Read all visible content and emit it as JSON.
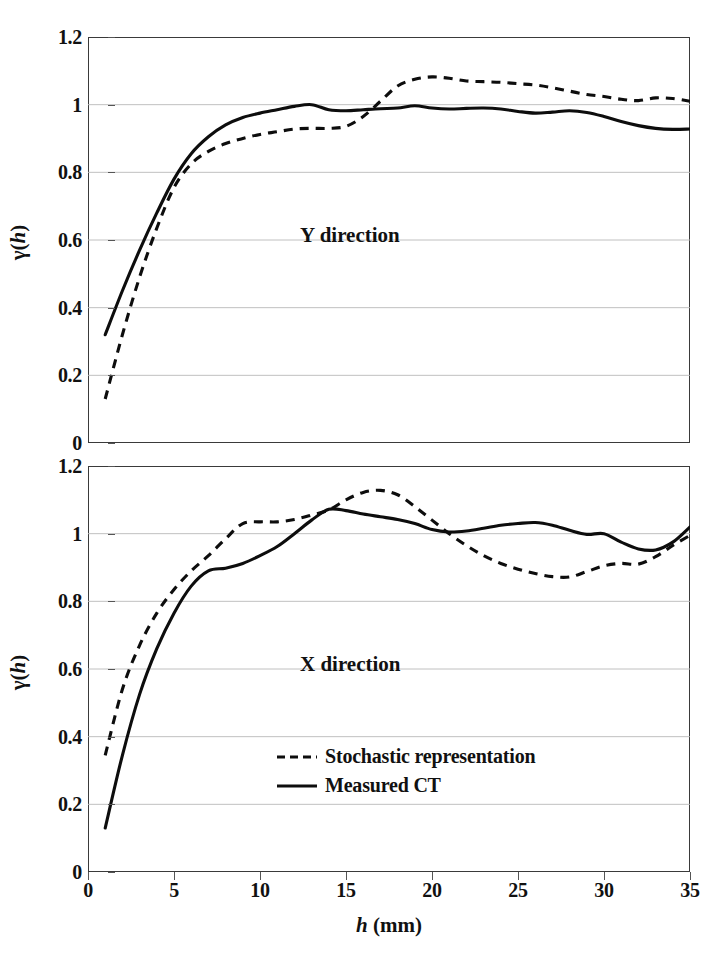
{
  "figure": {
    "background": "#ffffff",
    "line_color": "#0d0d0d",
    "grid_color": "#b9b9b9",
    "frame_color": "#3a3a3a"
  },
  "axes": {
    "y_title": "γ(h)",
    "y_title_symbol": "γ",
    "y_title_paren_open": "(",
    "y_title_var": "h",
    "y_title_paren_close": ")",
    "x_title_var": "h",
    "x_title_unit": " (mm)",
    "y_ticks": [
      "0",
      "0.2",
      "0.4",
      "0.6",
      "0.8",
      "1",
      "1.2"
    ],
    "x_ticks": [
      "0",
      "5",
      "10",
      "15",
      "20",
      "25",
      "30",
      "35"
    ]
  },
  "legend": {
    "items": [
      {
        "label": "Stochastic representation",
        "style": "dashed",
        "icon": "dashed-line-icon"
      },
      {
        "label": "Measured CT",
        "style": "solid",
        "icon": "solid-line-icon"
      }
    ]
  },
  "panels": {
    "upper": {
      "annotation": "Y direction"
    },
    "lower": {
      "annotation": "X direction"
    }
  },
  "chart_data": [
    {
      "type": "line",
      "title": "Y direction",
      "xlabel": "h (mm)",
      "ylabel": "γ(h)",
      "xlim": [
        0,
        35
      ],
      "ylim": [
        0,
        1.2
      ],
      "grid": true,
      "legend_position": "none",
      "x": [
        1,
        2,
        3,
        4,
        5,
        6,
        7,
        8,
        9,
        10,
        11,
        12,
        13,
        14,
        15,
        16,
        17,
        18,
        19,
        20,
        21,
        22,
        23,
        24,
        25,
        26,
        27,
        28,
        29,
        30,
        31,
        32,
        33,
        34,
        35
      ],
      "series": [
        {
          "name": "Measured CT",
          "style": "solid",
          "values": [
            0.32,
            0.45,
            0.57,
            0.68,
            0.78,
            0.855,
            0.905,
            0.94,
            0.962,
            0.975,
            0.985,
            0.995,
            1.0,
            0.985,
            0.982,
            0.985,
            0.988,
            0.99,
            0.997,
            0.99,
            0.987,
            0.989,
            0.99,
            0.987,
            0.98,
            0.975,
            0.978,
            0.982,
            0.977,
            0.965,
            0.95,
            0.938,
            0.93,
            0.927,
            0.928
          ]
        },
        {
          "name": "Stochastic representation",
          "style": "dashed",
          "values": [
            0.13,
            0.32,
            0.49,
            0.635,
            0.755,
            0.825,
            0.862,
            0.885,
            0.9,
            0.912,
            0.92,
            0.928,
            0.93,
            0.93,
            0.936,
            0.965,
            1.01,
            1.055,
            1.075,
            1.082,
            1.078,
            1.07,
            1.068,
            1.066,
            1.062,
            1.058,
            1.05,
            1.04,
            1.03,
            1.024,
            1.016,
            1.012,
            1.02,
            1.018,
            1.01
          ]
        }
      ]
    },
    {
      "type": "line",
      "title": "X direction",
      "xlabel": "h (mm)",
      "ylabel": "γ(h)",
      "xlim": [
        0,
        35
      ],
      "ylim": [
        0,
        1.2
      ],
      "grid": true,
      "legend_position": "inside-center",
      "x": [
        1,
        2,
        3,
        4,
        5,
        6,
        7,
        8,
        9,
        10,
        11,
        12,
        13,
        14,
        15,
        16,
        17,
        18,
        19,
        20,
        21,
        22,
        23,
        24,
        25,
        26,
        27,
        28,
        29,
        30,
        31,
        32,
        33,
        34,
        35
      ],
      "series": [
        {
          "name": "Measured CT",
          "style": "solid",
          "values": [
            0.13,
            0.345,
            0.525,
            0.66,
            0.765,
            0.845,
            0.89,
            0.898,
            0.912,
            0.935,
            0.962,
            1.0,
            1.04,
            1.072,
            1.068,
            1.058,
            1.05,
            1.042,
            1.03,
            1.012,
            1.005,
            1.008,
            1.016,
            1.025,
            1.03,
            1.033,
            1.025,
            1.01,
            0.998,
            1.0,
            0.975,
            0.955,
            0.952,
            0.975,
            1.02
          ]
        },
        {
          "name": "Stochastic representation",
          "style": "dashed",
          "values": [
            0.345,
            0.54,
            0.67,
            0.765,
            0.835,
            0.89,
            0.935,
            0.985,
            1.03,
            1.035,
            1.035,
            1.042,
            1.055,
            1.07,
            1.1,
            1.122,
            1.128,
            1.115,
            1.08,
            1.04,
            1.0,
            0.965,
            0.935,
            0.912,
            0.895,
            0.882,
            0.873,
            0.872,
            0.888,
            0.905,
            0.912,
            0.91,
            0.932,
            0.965,
            0.995
          ]
        }
      ]
    }
  ]
}
